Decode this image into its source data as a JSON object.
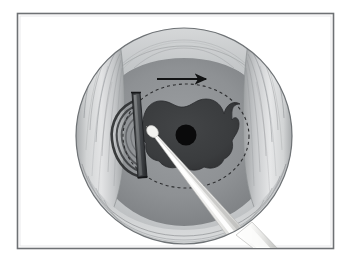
{
  "figure": {
    "description": "Grayscale medical illustration of a circular operative field seen through a retracted incision, showing striated muscle tissue walls, a dark irregular lesion with a central black opening, a dashed planned-resection outline, a directional arrow, a dark retractor blade at left, and a light instrument shaft entering from lower right.",
    "width": 351,
    "height": 263,
    "background_color": "#ffffff"
  },
  "frame": {
    "name": "image-border",
    "x": 17,
    "y": 13,
    "width": 317,
    "height": 236,
    "stroke_color": "#6e7174",
    "stroke_width": 1.6,
    "fill_color": "#ffffff"
  },
  "operative_field": {
    "label": "operative-field-circle",
    "center_x": 184,
    "center_y": 136,
    "radius": 108,
    "outline_color": "#6f7376",
    "rim_color": "#c9cbcc",
    "cavity_color": "#8d9093"
  },
  "tissue": {
    "muscle_left": {
      "label": "left-muscle-wall",
      "fill_color": "#d3d5d6",
      "fiber_color": "#8b8e91",
      "fiber_count": 9
    },
    "muscle_right": {
      "label": "right-muscle-wall",
      "fill_color": "#d6d8d9",
      "fiber_color": "#8b8e91",
      "fiber_count": 9
    },
    "upper_band": {
      "label": "upper-tissue-band",
      "fill_color": "#c3c5c7"
    },
    "lower_bands": {
      "label": "lower-tissue-bands",
      "fill_color": "#c0c3c5",
      "band_count": 4
    },
    "cavity_floor": {
      "label": "cavity-floor",
      "fill_color": "#8e9194"
    }
  },
  "lesion": {
    "label": "central-lesion",
    "fill_color": "#3b3c3e",
    "outline_color": "#2b2c2e",
    "center_x": 186,
    "center_y": 134,
    "approx_width": 96,
    "approx_height": 66
  },
  "opening": {
    "label": "central-opening",
    "fill_color": "#0a0a0b",
    "center_x": 186,
    "center_y": 135,
    "radius": 10.5
  },
  "dashed_outline": {
    "label": "planned-resection-margin",
    "center_x": 186,
    "center_y": 136,
    "radius_x": 63,
    "radius_y": 52,
    "stroke_color": "#2e2f31",
    "stroke_width": 1.1,
    "dash_pattern": "3 3"
  },
  "arrow": {
    "label": "direction-arrow",
    "x1": 157,
    "y1": 79,
    "x2": 208,
    "y2": 79,
    "color": "#121314",
    "stroke_width": 2.1,
    "direction": "right"
  },
  "blade_instrument": {
    "label": "retractor-blade",
    "body_color": "#4b4d4f",
    "edge_color": "#2a2b2d",
    "highlight_color": "#9a9d9f",
    "top_x": 133,
    "top_y": 93,
    "bottom_x": 143,
    "bottom_y": 178
  },
  "shaft_instrument": {
    "label": "instrument-shaft",
    "body_color_light": "#f7f7f6",
    "body_color_mid": "#dcdcda",
    "body_color_dark": "#b9bab8",
    "tip_x": 148,
    "tip_y": 131,
    "exit_x": 265,
    "exit_y": 252
  },
  "shadow_arcs": {
    "label": "blade-shadow-arcs",
    "color": "#1f2022",
    "count": 5
  }
}
